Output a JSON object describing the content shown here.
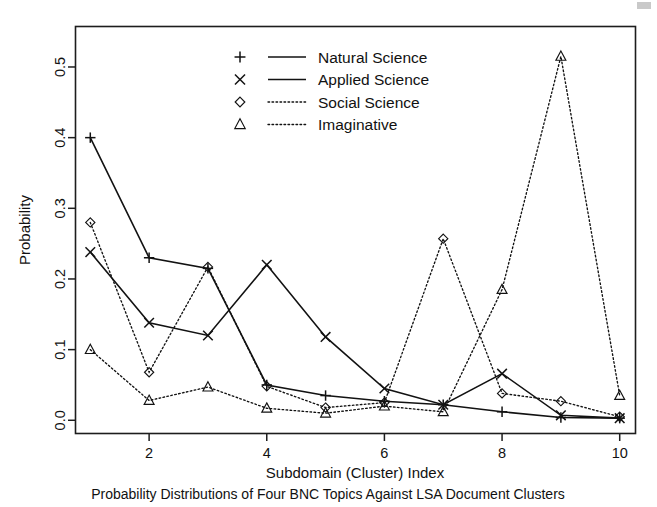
{
  "figure": {
    "caption": "Probability Distributions of Four BNC Topics Against LSA Document Clusters"
  },
  "axes": {
    "y_title": "Probability",
    "x_title": "Subdomain (Cluster) Index",
    "y_ticks": [
      "0.0",
      "0.1",
      "0.2",
      "0.3",
      "0.4",
      "0.5"
    ],
    "x_ticks": [
      "2",
      "4",
      "6",
      "8",
      "10"
    ]
  },
  "legend": {
    "entries": [
      {
        "label": "Natural Science",
        "marker": "plus-marker",
        "line": "solid"
      },
      {
        "label": "Applied Science",
        "marker": "cross-marker",
        "line": "solid"
      },
      {
        "label": "Social Science",
        "marker": "diamond-marker",
        "line": "dotted"
      },
      {
        "label": "Imaginative",
        "marker": "triangle-marker",
        "line": "dotted"
      }
    ]
  },
  "chart_data": {
    "type": "line",
    "title": "Probability Distributions of Four BNC Topics Against LSA Document Clusters",
    "xlabel": "Subdomain (Cluster) Index",
    "ylabel": "Probability",
    "x": [
      1,
      2,
      3,
      4,
      5,
      6,
      7,
      8,
      9,
      10
    ],
    "xlim": [
      0.74,
      10.26
    ],
    "ylim": [
      -0.018,
      0.558
    ],
    "grid": false,
    "legend_position": "top-center",
    "series": [
      {
        "name": "Natural Science",
        "marker": "plus",
        "linestyle": "solid",
        "color": "#121212",
        "values": [
          0.4,
          0.23,
          0.215,
          0.05,
          0.035,
          0.027,
          0.022,
          0.012,
          0.004,
          0.003
        ]
      },
      {
        "name": "Applied Science",
        "marker": "cross",
        "linestyle": "solid",
        "color": "#121212",
        "values": [
          0.238,
          0.138,
          0.12,
          0.22,
          0.118,
          0.045,
          0.022,
          0.066,
          0.007,
          0.003
        ]
      },
      {
        "name": "Social Science",
        "marker": "diamond",
        "linestyle": "dotted",
        "color": "#121212",
        "values": [
          0.28,
          0.068,
          0.217,
          0.048,
          0.018,
          0.025,
          0.257,
          0.038,
          0.027,
          0.005
        ]
      },
      {
        "name": "Imaginative",
        "marker": "triangle",
        "linestyle": "dotted",
        "color": "#121212",
        "values": [
          0.1,
          0.028,
          0.047,
          0.017,
          0.01,
          0.02,
          0.012,
          0.185,
          0.515,
          0.035
        ]
      }
    ]
  }
}
